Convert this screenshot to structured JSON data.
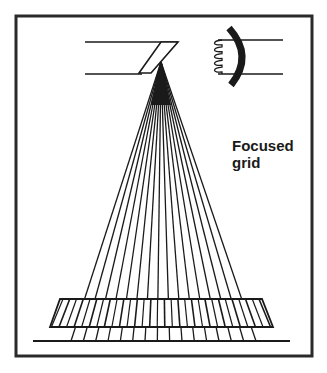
{
  "diagram": {
    "title": "Focused grid",
    "label_lines": [
      "Focused",
      "grid"
    ],
    "components": {
      "xray_tube": "x-ray tube with angled anode and cathode cup with filament",
      "beam": "diverging x-ray beam from focal spot",
      "grid": "focused grid with lead strips angled toward focal spot",
      "image_receptor": "receptor line below grid"
    },
    "ray_count": 16,
    "grid_strip_count": 30,
    "colors": {
      "ink": "#1a1a1a",
      "frame": "#2a2a2a",
      "background": "#ffffff"
    }
  }
}
